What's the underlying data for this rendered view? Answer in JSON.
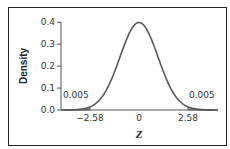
{
  "chart_data": {
    "type": "area",
    "title": "",
    "xlabel": "Z",
    "ylabel": "Density",
    "distribution": "standard normal",
    "x_range": [
      -4,
      4
    ],
    "ylim": [
      0.0,
      0.4
    ],
    "y_ticks": [
      "0.0",
      "0.1",
      "0.2",
      "0.3",
      "0.4"
    ],
    "x_ticks": [
      "−2.58",
      "0",
      "2.58"
    ],
    "x_tick_values": [
      -2.58,
      0,
      2.58
    ],
    "shaded_regions": [
      {
        "from": -4,
        "to": -2.58,
        "area": 0.005,
        "label": "0.005"
      },
      {
        "from": 2.58,
        "to": 4,
        "area": 0.005,
        "label": "0.005"
      }
    ],
    "grid": false,
    "legend": null,
    "colors": {
      "curve": "#5a5a5a",
      "shade": "#9a9a9a",
      "axis": "#555555"
    }
  }
}
